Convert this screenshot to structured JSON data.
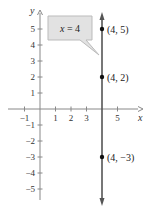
{
  "chart_data": {
    "type": "line",
    "title": "",
    "xlabel": "x",
    "ylabel": "y",
    "xlim": [
      -1.5,
      5.5
    ],
    "ylim": [
      -6,
      6
    ],
    "x_ticks": [
      -1,
      1,
      2,
      3,
      5
    ],
    "x_tick_labels": [
      "−1",
      "1",
      "2",
      "3",
      "5"
    ],
    "y_ticks": [
      5,
      4,
      3,
      2,
      1,
      -1,
      -2,
      -3,
      -4,
      -5
    ],
    "y_tick_labels": [
      "5",
      "4",
      "3",
      "2",
      "1",
      "−1",
      "−2",
      "−3",
      "−4",
      "−5"
    ],
    "grid": false,
    "series": [
      {
        "name": "x = 4",
        "type": "vertical-line",
        "x": 4,
        "color": "#555555"
      }
    ],
    "points": [
      {
        "x": 4,
        "y": 5,
        "label": "(4, 5)"
      },
      {
        "x": 4,
        "y": 2,
        "label": "(4, 2)"
      },
      {
        "x": 4,
        "y": -3,
        "label": "(4, −3)"
      }
    ],
    "annotations": [
      {
        "text": "x = 4",
        "type": "callout",
        "points_to": "line x = 4"
      }
    ]
  },
  "labels": {
    "x_axis": "x",
    "y_axis": "y",
    "callout": "x = 4",
    "points": [
      "(4, 5)",
      "(4, 2)",
      "(4, −3)"
    ]
  },
  "colors": {
    "axis": "#888888",
    "line": "#555555",
    "callout_fill": "#e2e2e2",
    "callout_stroke": "#bbbbbb",
    "point": "#111111"
  }
}
